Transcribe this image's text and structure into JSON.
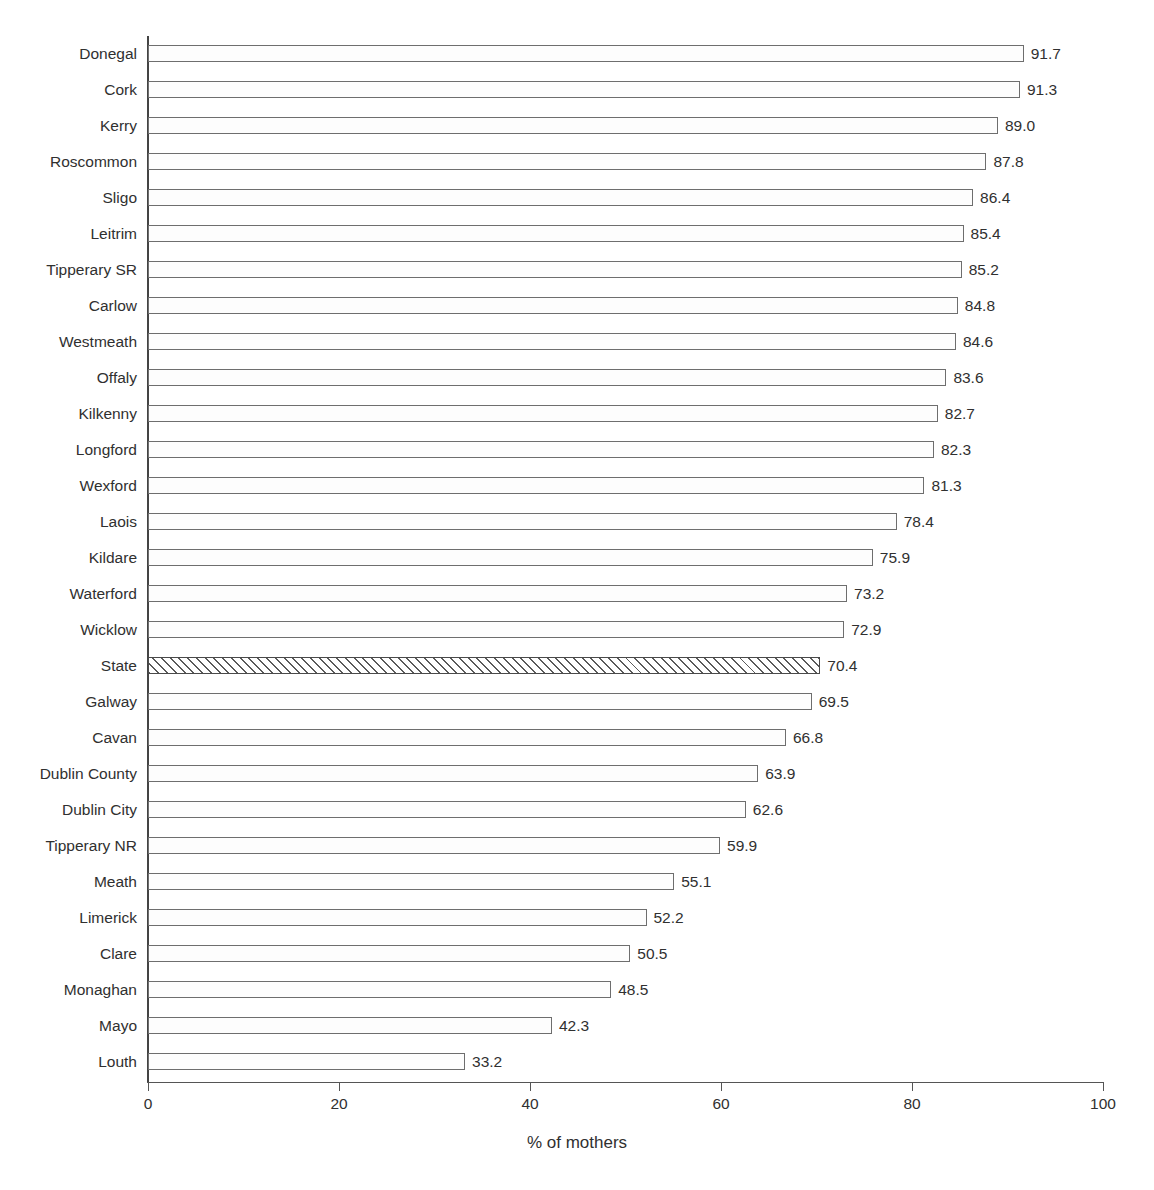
{
  "chart_data": {
    "type": "bar",
    "orientation": "horizontal",
    "title": "",
    "xlabel": "% of mothers",
    "ylabel": "",
    "xlim": [
      0,
      100
    ],
    "xticks": [
      "0",
      "20",
      "40",
      "60",
      "80",
      "100"
    ],
    "grid": false,
    "legend": false,
    "highlight_category": "State",
    "highlight_style": "diagonal-hatch",
    "categories": [
      "Donegal",
      "Cork",
      "Kerry",
      "Roscommon",
      "Sligo",
      "Leitrim",
      "Tipperary SR",
      "Carlow",
      "Westmeath",
      "Offaly",
      "Kilkenny",
      "Longford",
      "Wexford",
      "Laois",
      "Kildare",
      "Waterford",
      "Wicklow",
      "State",
      "Galway",
      "Cavan",
      "Dublin County",
      "Dublin City",
      "Tipperary NR",
      "Meath",
      "Limerick",
      "Clare",
      "Monaghan",
      "Mayo",
      "Louth"
    ],
    "values": [
      91.7,
      91.3,
      89.0,
      87.8,
      86.4,
      85.4,
      85.2,
      84.8,
      84.6,
      83.6,
      82.7,
      82.3,
      81.3,
      78.4,
      75.9,
      73.2,
      72.9,
      70.4,
      69.5,
      66.8,
      63.9,
      62.6,
      59.9,
      55.1,
      52.2,
      50.5,
      48.5,
      42.3,
      33.2
    ],
    "value_labels": [
      "91.7",
      "91.3",
      "89.0",
      "87.8",
      "86.4",
      "85.4",
      "85.2",
      "84.8",
      "84.6",
      "83.6",
      "82.7",
      "82.3",
      "81.3",
      "78.4",
      "75.9",
      "73.2",
      "72.9",
      "70.4",
      "69.5",
      "66.8",
      "63.9",
      "62.6",
      "59.9",
      "55.1",
      "52.2",
      "50.5",
      "48.5",
      "42.3",
      "33.2"
    ],
    "colors": {
      "bar_fill": "#fdfdfd",
      "bar_border": "#6e6e6e",
      "highlight_hatch": "#5a5a5a",
      "axis": "#555555",
      "text": "#303030"
    }
  }
}
